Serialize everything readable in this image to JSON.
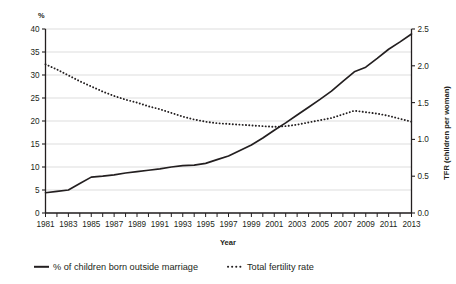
{
  "chart_data": {
    "type": "line",
    "title": "",
    "subtitle": "",
    "xlabel": "Year",
    "ylabel": "%",
    "y2label": "TFR (children per woman)",
    "grid": true,
    "legend_position": "bottom",
    "xlim": [
      1981,
      2013
    ],
    "ylim": [
      0,
      40
    ],
    "y2lim": [
      0.0,
      2.5
    ],
    "x": [
      1981,
      1982,
      1983,
      1984,
      1985,
      1986,
      1987,
      1988,
      1989,
      1990,
      1991,
      1992,
      1993,
      1994,
      1995,
      1996,
      1997,
      1998,
      1999,
      2000,
      2001,
      2002,
      2003,
      2004,
      2005,
      2006,
      2007,
      2008,
      2009,
      2010,
      2011,
      2012,
      2013
    ],
    "xtick_labels": [
      "1981",
      "1983",
      "1985",
      "1987",
      "1989",
      "1991",
      "1993",
      "1995",
      "1997",
      "1999",
      "2001",
      "2003",
      "2005",
      "2007",
      "2009",
      "2011",
      "2013"
    ],
    "ytick_labels": [
      "0",
      "5",
      "10",
      "15",
      "20",
      "25",
      "30",
      "35",
      "40"
    ],
    "ytick_values": [
      0,
      5,
      10,
      15,
      20,
      25,
      30,
      35,
      40
    ],
    "y2tick_labels": [
      "0.0",
      "0.5",
      "1.0",
      "1.5",
      "2.0",
      "2.5"
    ],
    "y2tick_values": [
      0.0,
      0.5,
      1.0,
      1.5,
      2.0,
      2.5
    ],
    "series": [
      {
        "name": "% of children born outside marriage",
        "axis": "left",
        "style": "solid",
        "color": "#231f20",
        "values": [
          4.4,
          4.7,
          5.0,
          6.4,
          7.8,
          8.0,
          8.3,
          8.7,
          9.0,
          9.3,
          9.6,
          10.0,
          10.3,
          10.4,
          10.8,
          11.6,
          12.4,
          13.6,
          14.8,
          16.3,
          18.0,
          19.6,
          21.3,
          23.0,
          24.7,
          26.5,
          28.6,
          30.7,
          31.7,
          33.6,
          35.6,
          37.2,
          38.9
        ]
      },
      {
        "name": "Total fertility rate",
        "axis": "right",
        "style": "dotted",
        "color": "#231f20",
        "values": [
          2.02,
          1.95,
          1.87,
          1.79,
          1.72,
          1.65,
          1.59,
          1.54,
          1.5,
          1.45,
          1.41,
          1.36,
          1.31,
          1.27,
          1.24,
          1.22,
          1.21,
          1.2,
          1.19,
          1.18,
          1.17,
          1.18,
          1.2,
          1.23,
          1.26,
          1.29,
          1.34,
          1.39,
          1.37,
          1.35,
          1.32,
          1.28,
          1.24
        ]
      }
    ],
    "legend": [
      {
        "label": "% of children born outside marriage",
        "marker": "solid-line"
      },
      {
        "label": "Total fertility rate",
        "marker": "dotted-line"
      }
    ],
    "colors": {
      "axis": "#231f20",
      "grid": "#d9d9d9",
      "line": "#231f20",
      "background": "#ffffff"
    }
  }
}
